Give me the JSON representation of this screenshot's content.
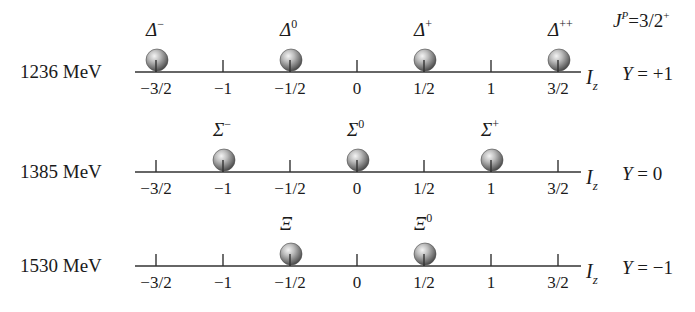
{
  "spin_parity": {
    "symbol": "J",
    "sup": "P",
    "value": "=3/2",
    "value_sup": "+"
  },
  "axis": {
    "label": "I",
    "label_sub": "z",
    "ticks": [
      "−3/2",
      "−1",
      "−1/2",
      "0",
      "1/2",
      "1",
      "3/2"
    ],
    "tick_values": [
      -1.5,
      -1,
      -0.5,
      0,
      0.5,
      1,
      1.5
    ]
  },
  "colors": {
    "line": "#333333",
    "text": "#1a1a1a",
    "sphere_light": "#f2f2f2",
    "sphere_mid": "#9a9a9a",
    "sphere_dark": "#3c3c3c"
  },
  "rows": [
    {
      "mass": "1236 MeV",
      "hypercharge": "Y = +1",
      "y_symbol": "Y",
      "y_value": " = +1",
      "particles": [
        {
          "name": "Δ",
          "charge": "−",
          "iz": -1.5
        },
        {
          "name": "Δ",
          "charge": "0",
          "iz": -0.5
        },
        {
          "name": "Δ",
          "charge": "+",
          "iz": 0.5
        },
        {
          "name": "Δ",
          "charge": "++",
          "iz": 1.5
        }
      ]
    },
    {
      "mass": "1385 MeV",
      "hypercharge": "Y = 0",
      "y_symbol": "Y",
      "y_value": " = 0",
      "particles": [
        {
          "name": "Σ",
          "charge": "−",
          "iz": -1
        },
        {
          "name": "Σ",
          "charge": "0",
          "iz": 0
        },
        {
          "name": "Σ",
          "charge": "+",
          "iz": 1
        }
      ]
    },
    {
      "mass": "1530 MeV",
      "hypercharge": "Y = −1",
      "y_symbol": "Y",
      "y_value": " = −1",
      "particles": [
        {
          "name": "Ξ",
          "charge": "",
          "iz": -0.5
        },
        {
          "name": "Ξ",
          "charge": "0",
          "iz": 0.5
        }
      ]
    }
  ]
}
